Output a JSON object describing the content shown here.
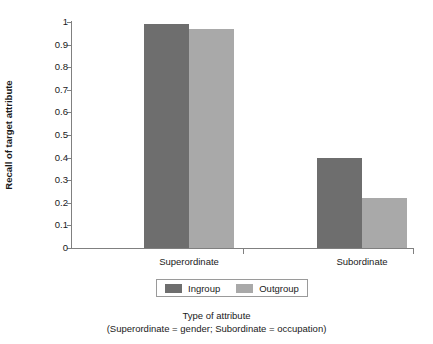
{
  "chart_data": {
    "type": "bar",
    "title": "",
    "xlabel": "Type of attribute",
    "xlabel_note": "(Superordinate = gender; Subordinate = occupation)",
    "ylabel": "Recall of target attribute",
    "categories": [
      "Superordinate",
      "Subordinate"
    ],
    "series": [
      {
        "name": "Ingroup",
        "color": "#6e6e6e",
        "values": [
          0.99,
          0.4
        ]
      },
      {
        "name": "Outgroup",
        "color": "#a9a9a9",
        "values": [
          0.97,
          0.22
        ]
      }
    ],
    "ylim": [
      0,
      1
    ],
    "ytick_labels": [
      "0",
      "0.1",
      "0.2",
      "0.3",
      "0.4",
      "0.5",
      "0.6",
      "0.7",
      "0.8",
      "0.9",
      "1"
    ],
    "ytick_values": [
      0,
      0.1,
      0.2,
      0.3,
      0.4,
      0.5,
      0.6,
      0.7,
      0.8,
      0.9,
      1
    ],
    "grid": false,
    "legend_position": "bottom",
    "axis_color": "#808080",
    "background": "#ffffff"
  },
  "legend": {
    "entries": [
      {
        "label": "Ingroup",
        "color": "#6e6e6e"
      },
      {
        "label": "Outgroup",
        "color": "#a9a9a9"
      }
    ]
  }
}
